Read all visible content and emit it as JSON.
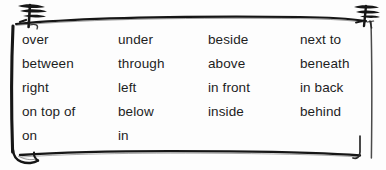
{
  "page": {
    "background_color": "#fdfdfd",
    "ink_color": "#1d1d1d",
    "cutoff_text_above_box": "",
    "cutoff_text_color": "#c9c9c9"
  },
  "frame": {
    "style": "hand-drawn-rounded-box",
    "stroke_color": "#161616",
    "corner_marks": {
      "top_left": "scribble-knot-mark",
      "top_right": "scribble-knot-mark",
      "bottom_left": "curled-page-flap",
      "bottom_right": "hook-tick-mark"
    }
  },
  "word_grid": {
    "columns": [
      {
        "name": "column-1",
        "words": [
          "over",
          "between",
          "right",
          "on top of",
          "on"
        ]
      },
      {
        "name": "column-2",
        "words": [
          "under",
          "through",
          "left",
          "below",
          "in"
        ]
      },
      {
        "name": "column-3",
        "words": [
          "beside",
          "above",
          "in front",
          "inside"
        ]
      },
      {
        "name": "column-4",
        "words": [
          "next to",
          "beneath",
          "in back",
          "behind"
        ]
      }
    ]
  }
}
